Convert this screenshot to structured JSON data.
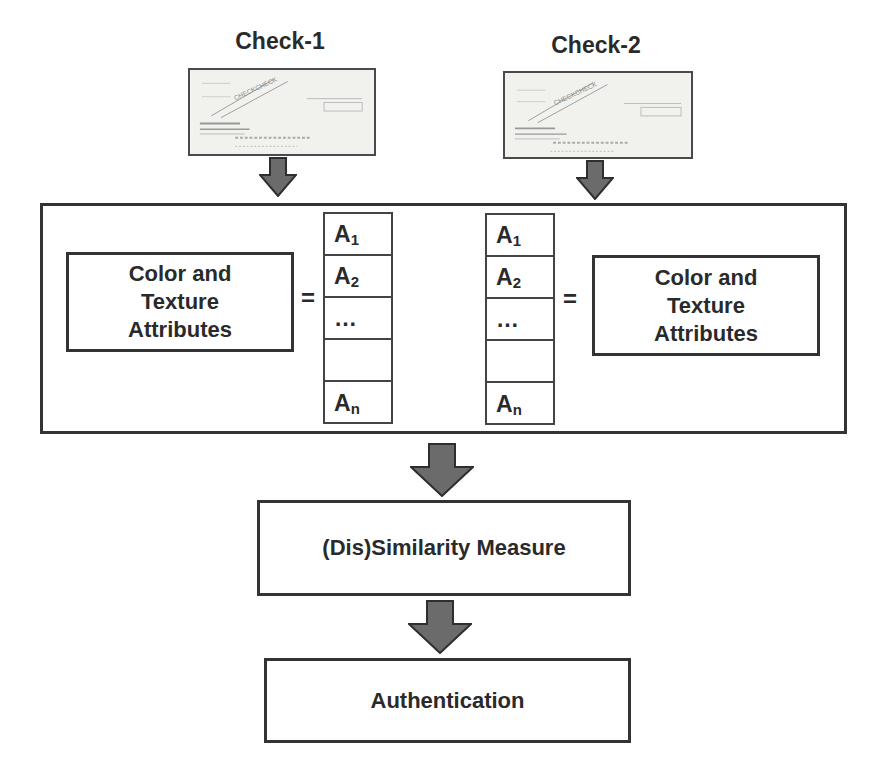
{
  "checks": [
    {
      "label": "Check-1",
      "image_icon": "check-image-icon"
    },
    {
      "label": "Check-2",
      "image_icon": "check-image-icon"
    }
  ],
  "feature_box": {
    "left": {
      "attributes_label": "Color and\nTexture\nAttributes",
      "equals": "=",
      "vector": [
        {
          "base": "A",
          "sub": "1"
        },
        {
          "base": "A",
          "sub": "2"
        },
        {
          "base": "…",
          "sub": ""
        },
        {
          "base": "",
          "sub": ""
        },
        {
          "base": "A",
          "sub": "n"
        }
      ]
    },
    "right": {
      "attributes_label": "Color and\nTexture\nAttributes",
      "equals": "=",
      "vector": [
        {
          "base": "A",
          "sub": "1"
        },
        {
          "base": "A",
          "sub": "2"
        },
        {
          "base": "…",
          "sub": ""
        },
        {
          "base": "",
          "sub": ""
        },
        {
          "base": "A",
          "sub": "n"
        }
      ]
    }
  },
  "steps": {
    "similarity": "(Dis)Similarity Measure",
    "authentication": "Authentication"
  },
  "colors": {
    "arrow_fill": "#6b6b6b",
    "arrow_stroke": "#2e2e2e",
    "border": "#333333"
  }
}
